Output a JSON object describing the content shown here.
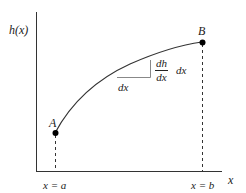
{
  "diagram": {
    "y_axis_label": "h(x)",
    "x_axis_label": "x",
    "points": [
      {
        "name": "A",
        "x_label": "x = a"
      },
      {
        "name": "B",
        "x_label": "x = b"
      }
    ],
    "triangle": {
      "run_label": "dx",
      "rise_fraction": {
        "numerator": "dh",
        "denominator": "dx"
      },
      "rise_suffix": "dx"
    },
    "colors": {
      "line": "#333333",
      "point": "#000000",
      "triangle": "#888888",
      "background": "#ffffff"
    }
  }
}
